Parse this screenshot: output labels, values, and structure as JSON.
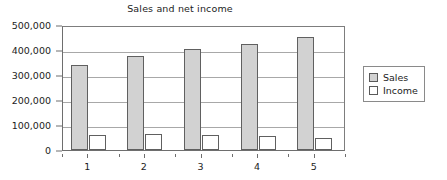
{
  "chart_data": {
    "type": "bar",
    "title": "Sales and net income",
    "xlabel": "",
    "ylabel": "",
    "categories": [
      "1",
      "2",
      "3",
      "4",
      "5"
    ],
    "series": [
      {
        "name": "Sales",
        "color": "#d2d2d2",
        "values": [
          340000,
          375000,
          403000,
          423000,
          452000
        ]
      },
      {
        "name": "Income",
        "color": "#ffffff",
        "values": [
          62000,
          65000,
          61000,
          57000,
          48000
        ]
      }
    ],
    "ylim": [
      0,
      500000
    ],
    "ytick_values": [
      0,
      100000,
      200000,
      300000,
      400000,
      500000
    ],
    "ytick_labels": [
      "0",
      "100,000",
      "200,000",
      "300,000",
      "400,000",
      "500,000"
    ],
    "grid": true,
    "legend_position": "right"
  },
  "legend": {
    "entries": [
      {
        "label": "Sales"
      },
      {
        "label": "Income"
      }
    ]
  }
}
